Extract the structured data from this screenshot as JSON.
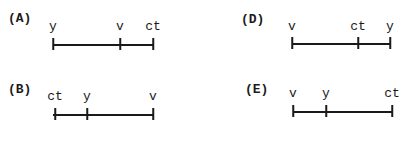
{
  "panels": [
    {
      "id": "A",
      "label": "(A)",
      "label_pos": {
        "x": 8,
        "y": 12
      },
      "line": {
        "x1": 53,
        "x2": 153,
        "y": 44
      },
      "ticks": [
        {
          "name": "y",
          "text": "y",
          "x": 53
        },
        {
          "name": "v",
          "text": "v",
          "x": 120
        },
        {
          "name": "ct",
          "text": "ct",
          "x": 153
        }
      ],
      "text_y": 20
    },
    {
      "id": "B",
      "label": "(B)",
      "label_pos": {
        "x": 8,
        "y": 83
      },
      "line": {
        "x1": 53,
        "x2": 153,
        "y": 114
      },
      "ticks": [
        {
          "name": "ct",
          "text": "ct",
          "x": 55
        },
        {
          "name": "y",
          "text": "y",
          "x": 87
        },
        {
          "name": "v",
          "text": "v",
          "x": 153
        }
      ],
      "text_y": 90
    },
    {
      "id": "D",
      "label": "(D)",
      "label_pos": {
        "x": 241,
        "y": 13
      },
      "line": {
        "x1": 292,
        "x2": 390,
        "y": 43
      },
      "ticks": [
        {
          "name": "v",
          "text": "v",
          "x": 292
        },
        {
          "name": "ct",
          "text": "ct",
          "x": 358
        },
        {
          "name": "y",
          "text": "y",
          "x": 390
        }
      ],
      "text_y": 20
    },
    {
      "id": "E",
      "label": "(E)",
      "label_pos": {
        "x": 245,
        "y": 83
      },
      "line": {
        "x1": 293,
        "x2": 392,
        "y": 111
      },
      "ticks": [
        {
          "name": "v",
          "text": "v",
          "x": 293
        },
        {
          "name": "y",
          "text": "y",
          "x": 326
        },
        {
          "name": "ct",
          "text": "ct",
          "x": 392
        }
      ],
      "text_y": 87
    }
  ]
}
